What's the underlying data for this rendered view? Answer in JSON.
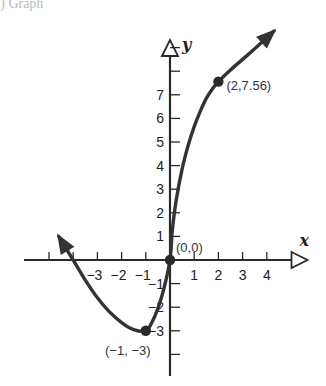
{
  "header_fragment": "a) Graph",
  "chart_data": {
    "type": "line",
    "title": "",
    "xlabel": "x",
    "ylabel": "y",
    "xlim": [
      -6.1,
      5.6
    ],
    "ylim": [
      -4.8,
      9.2
    ],
    "grid": false,
    "x_tick_labels": [
      {
        "value": -3,
        "label": "−3"
      },
      {
        "value": -2,
        "label": "−2"
      },
      {
        "value": -1,
        "label": "−1"
      },
      {
        "value": 1,
        "label": "1"
      },
      {
        "value": 2,
        "label": "2"
      },
      {
        "value": 3,
        "label": "3"
      },
      {
        "value": 4,
        "label": "4"
      }
    ],
    "x_ticks": [
      -5,
      -4,
      -3,
      -2,
      -1,
      1,
      2,
      3,
      4
    ],
    "y_tick_labels": [
      {
        "value": 1,
        "label": "1"
      },
      {
        "value": 2,
        "label": "2"
      },
      {
        "value": 3,
        "label": "3"
      },
      {
        "value": 4,
        "label": "4"
      },
      {
        "value": 5,
        "label": "5"
      },
      {
        "value": 6,
        "label": "6"
      },
      {
        "value": 7,
        "label": "7"
      },
      {
        "value": -1,
        "label": "−1"
      },
      {
        "value": -2,
        "label": "−2"
      },
      {
        "value": -3,
        "label": "−3"
      }
    ],
    "y_ticks": [
      -4,
      -3,
      -2,
      -1,
      1,
      2,
      3,
      4,
      5,
      6,
      7,
      8,
      9
    ],
    "series": [
      {
        "name": "curve",
        "color": "#333333",
        "arrow_both_ends": true,
        "x": [
          -4.6,
          -4,
          -3.5,
          -3,
          -2.5,
          -2,
          -1.5,
          -1,
          -0.75,
          -0.5,
          -0.25,
          0,
          0.1,
          0.25,
          0.5,
          0.75,
          1,
          1.25,
          1.5,
          1.75,
          2,
          2.5,
          3,
          3.5,
          4.3
        ],
        "y": [
          1.0,
          0,
          -0.85,
          -1.6,
          -2.2,
          -2.65,
          -2.95,
          -3.0,
          -2.65,
          -2.05,
          -1.2,
          0,
          1.3,
          2.5,
          3.85,
          4.85,
          5.65,
          6.3,
          6.85,
          7.25,
          7.56,
          8.05,
          8.5,
          8.95,
          9.7
        ]
      }
    ],
    "points": [
      {
        "x": 0,
        "y": 0,
        "label": "(0,0)"
      },
      {
        "x": 2,
        "y": 7.56,
        "label": "(2,7.56)"
      },
      {
        "x": -1,
        "y": -3,
        "label": "(−1, −3)"
      }
    ]
  }
}
